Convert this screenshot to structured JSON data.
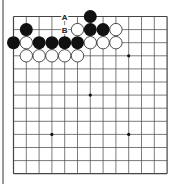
{
  "diagram": {
    "type": "go-board",
    "size": 13,
    "grid": {
      "x0": 13.5,
      "y0": 16.5,
      "dx": 12.8,
      "dy": 13.1
    },
    "colors": {
      "line": "#444444",
      "black": "#111111",
      "white": "#ffffff",
      "stone_edge": "#222222",
      "side_bar": "#9a9a9a"
    },
    "star_points": [
      [
        3,
        3
      ],
      [
        9,
        3
      ],
      [
        6,
        6
      ],
      [
        3,
        9
      ],
      [
        9,
        9
      ]
    ],
    "black_stones": [
      [
        6,
        0
      ],
      [
        1,
        1
      ],
      [
        6,
        1
      ],
      [
        7,
        1
      ],
      [
        0,
        2
      ],
      [
        2,
        2
      ],
      [
        3,
        2
      ],
      [
        4,
        2
      ],
      [
        5,
        2
      ]
    ],
    "white_stones": [
      [
        5,
        1
      ],
      [
        8,
        1
      ],
      [
        1,
        2
      ],
      [
        6,
        2
      ],
      [
        7,
        2
      ],
      [
        8,
        2
      ],
      [
        1,
        3
      ],
      [
        2,
        3
      ],
      [
        3,
        3
      ],
      [
        4,
        3
      ],
      [
        5,
        3
      ]
    ],
    "labels": [
      {
        "text": "A",
        "col": 4,
        "row": 0
      },
      {
        "text": "B",
        "col": 4,
        "row": 1
      }
    ]
  }
}
